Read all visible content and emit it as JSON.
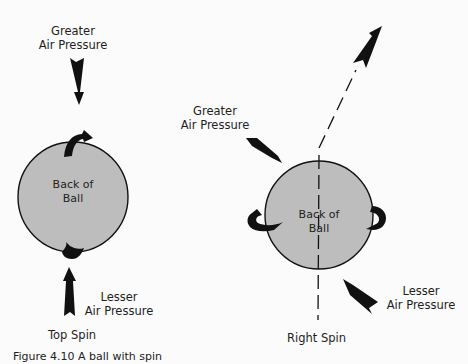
{
  "figure": {
    "caption": "Figure 4.10  A ball with spin",
    "colors": {
      "ball_fill": "#bdbdbd",
      "ink": "#111111",
      "background": "#fbfbfb"
    },
    "left_panel": {
      "title": "Top Spin",
      "ball_label_line1": "Back of",
      "ball_label_line2": "Ball",
      "top_pressure_line1": "Greater",
      "top_pressure_line2": "Air Pressure",
      "bottom_pressure_line1": "Lesser",
      "bottom_pressure_line2": "Air Pressure",
      "icons": [
        "down-pressure-arrow-icon",
        "top-spin-curl-icon",
        "bottom-spin-curl-icon",
        "up-pressure-arrow-icon"
      ]
    },
    "right_panel": {
      "title": "Right Spin",
      "ball_label_line1": "Back of",
      "ball_label_line2": "Ball",
      "upper_pressure_line1": "Greater",
      "upper_pressure_line2": "Air Pressure",
      "lower_pressure_line1": "Lesser",
      "lower_pressure_line2": "Air Pressure",
      "icons": [
        "trajectory-arrow-icon",
        "left-spin-curl-icon",
        "right-spin-curl-icon",
        "greater-pressure-arrow-icon",
        "lesser-pressure-arrow-icon"
      ]
    }
  }
}
